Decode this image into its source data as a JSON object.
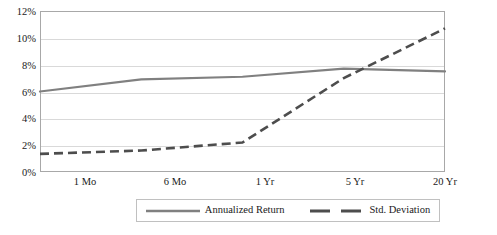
{
  "chart_data": {
    "type": "line",
    "title": "Annualized Return and Standard Deviation",
    "subtitle": "",
    "xlabel": "",
    "ylabel": "",
    "categories": [
      "1 Mo",
      "6 Mo",
      "1 Yr",
      "5 Yr",
      "20 Yr"
    ],
    "series": [
      {
        "name": "Annualized Return",
        "values": [
          6.0,
          6.9,
          7.1,
          7.7,
          7.5
        ],
        "style": "solid",
        "color": "#808080"
      },
      {
        "name": "Std. Deviation",
        "values": [
          1.35,
          1.6,
          2.2,
          7.0,
          10.7
        ],
        "style": "dashed",
        "color": "#4d4d4d"
      }
    ],
    "ylim": [
      0,
      12
    ],
    "ytick_labels": [
      "0%",
      "2%",
      "4%",
      "6%",
      "8%",
      "10%",
      "12%"
    ],
    "ytick_values": [
      0,
      2,
      4,
      6,
      8,
      10,
      12
    ],
    "ytick_format": "percent",
    "grid": "horizontal",
    "legend_position": "bottom",
    "plot_background": "#ffffff",
    "gridline_color": "#d9d9d9",
    "border_color": "#a8a8a8"
  },
  "legend": {
    "entries": [
      {
        "label": "Annualized Return"
      },
      {
        "label": "Std. Deviation"
      }
    ]
  }
}
